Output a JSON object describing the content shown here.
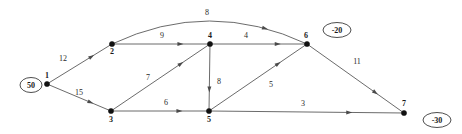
{
  "chart_data": {
    "type": "diagram",
    "title": "",
    "subtitle": "",
    "xlabel": "",
    "ylabel": "",
    "nodes": [
      {
        "id": "1",
        "label": "1",
        "x": 47,
        "y": 84,
        "label_dx": 0,
        "label_dy": -6
      },
      {
        "id": "2",
        "label": "2",
        "x": 112,
        "y": 44,
        "label_dx": 0,
        "label_dy": 10
      },
      {
        "id": "3",
        "label": "3",
        "x": 111,
        "y": 111,
        "label_dx": 0,
        "label_dy": 11
      },
      {
        "id": "4",
        "label": "4",
        "x": 210,
        "y": 44,
        "label_dx": 0,
        "label_dy": -6
      },
      {
        "id": "5",
        "label": "5",
        "x": 209,
        "y": 111,
        "label_dx": 0,
        "label_dy": 11
      },
      {
        "id": "6",
        "label": "6",
        "x": 307,
        "y": 44,
        "label_dx": -1,
        "label_dy": -6
      },
      {
        "id": "7",
        "label": "7",
        "x": 404,
        "y": 113,
        "label_dx": 0,
        "label_dy": -7
      }
    ],
    "supplies": [
      {
        "node": "1",
        "value": "50",
        "x": 31,
        "y": 85,
        "rx": 11,
        "ry": 7.5
      },
      {
        "node": "6",
        "value": "-20",
        "x": 337,
        "y": 30,
        "rx": 14,
        "ry": 7.5
      },
      {
        "node": "7",
        "value": "-30",
        "x": 437,
        "y": 120,
        "rx": 14,
        "ry": 7.5
      }
    ],
    "edges": [
      {
        "from": "1",
        "to": "2",
        "cost": "12",
        "label_x": 63,
        "label_y": 61,
        "curved": false
      },
      {
        "from": "1",
        "to": "3",
        "cost": "15",
        "label_x": 79,
        "label_y": 95,
        "curved": false
      },
      {
        "from": "2",
        "to": "4",
        "cost": "9",
        "label_x": 162,
        "label_y": 38,
        "curved": false
      },
      {
        "from": "2",
        "to": "6",
        "cost": "8",
        "label_x": 207,
        "label_y": 15,
        "curved": true
      },
      {
        "from": "3",
        "to": "4",
        "cost": "7",
        "label_x": 148,
        "label_y": 80,
        "curved": false
      },
      {
        "from": "3",
        "to": "5",
        "cost": "6",
        "label_x": 166,
        "label_y": 105,
        "curved": false
      },
      {
        "from": "4",
        "to": "6",
        "cost": "4",
        "label_x": 246,
        "label_y": 38,
        "curved": false
      },
      {
        "from": "4",
        "to": "5",
        "cost": "8",
        "label_x": 219,
        "label_y": 84,
        "curved": false
      },
      {
        "from": "5",
        "to": "6",
        "cost": "5",
        "label_x": 271,
        "label_y": 87,
        "curved": false
      },
      {
        "from": "5",
        "to": "7",
        "cost": "3",
        "label_x": 303,
        "label_y": 106,
        "curved": false
      },
      {
        "from": "6",
        "to": "7",
        "cost": "11",
        "label_x": 357,
        "label_y": 64,
        "curved": false
      }
    ],
    "colors": {
      "background": "#ffffff",
      "edge": "#5a5a5a",
      "node": "#111111",
      "text": "#1a1a1a"
    }
  }
}
